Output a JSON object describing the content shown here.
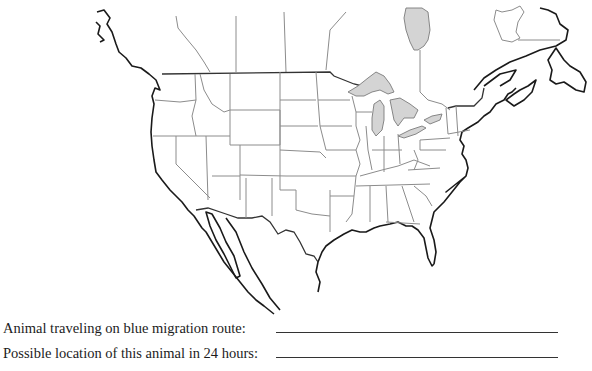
{
  "map": {
    "title": "North America outline map with U.S. state borders",
    "colors": {
      "coastline": "#1a1a1a",
      "border": "#8c8c8c",
      "lake_fill": "#d4d4d4",
      "background": "#ffffff"
    }
  },
  "questions": [
    {
      "label": "Animal traveling on blue migration route:",
      "answer": ""
    },
    {
      "label": "Possible location of this animal in 24 hours:",
      "answer": ""
    }
  ]
}
